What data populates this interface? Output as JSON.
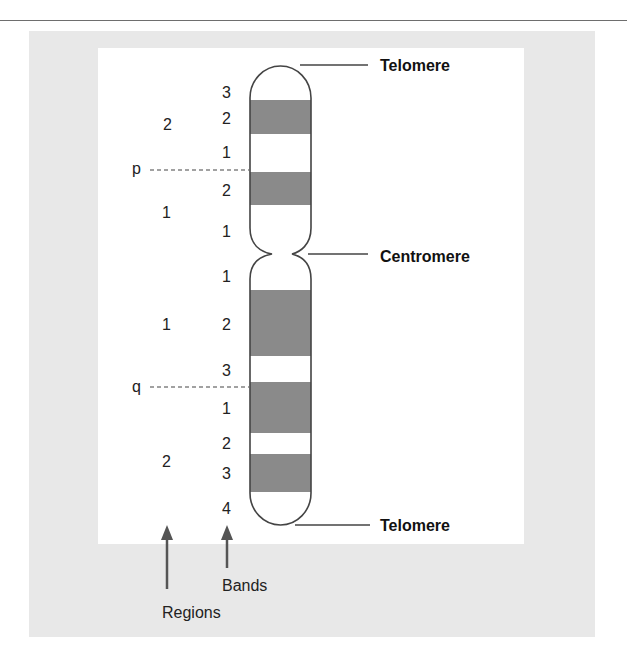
{
  "figure": {
    "arm_labels": {
      "p": "p",
      "q": "q"
    },
    "callouts": {
      "top_telomere": "Telomere",
      "centromere": "Centromere",
      "bottom_telomere": "Telomere"
    },
    "region_labels_p": [
      "2",
      "1"
    ],
    "region_labels_q": [
      "1",
      "2"
    ],
    "band_labels_p": [
      "3",
      "2",
      "1",
      "2",
      "1"
    ],
    "band_labels_q": [
      "1",
      "2",
      "3",
      "1",
      "2",
      "3",
      "4"
    ],
    "arrows": {
      "bands": "Bands",
      "regions": "Regions"
    },
    "colors": {
      "band": "#8a8a8a",
      "outline": "#444444",
      "panel": "#e8e8e8"
    }
  }
}
